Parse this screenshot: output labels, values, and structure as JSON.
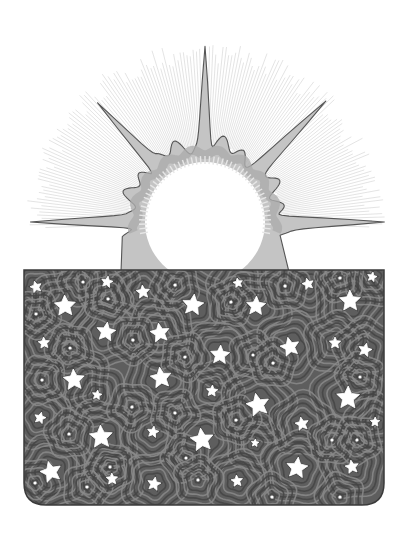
{
  "image": {
    "title": "Sun rising over a starry night panel",
    "description": "Grayscale illustration: a white sun disk with a spiky gray corona and faint radiating hatched rays, partially hidden behind a dark gray rectangular panel filled with white stars surrounded by concentric contour rings.",
    "width": 409,
    "height": 541
  },
  "colors": {
    "background": "#ffffff",
    "sun_core": "#ffffff",
    "corona_fill": "#c4c4c4",
    "corona_inner": "#adadad",
    "corona_stroke": "#555555",
    "ray_hatch": "#cfcfcf",
    "panel_fill": "#5e5e5e",
    "panel_ring_light": "#8a8a8a",
    "panel_ring_dark": "#444444",
    "panel_stroke": "#3a3a3a",
    "star_fill": "#ffffff"
  },
  "sun": {
    "cx": 205,
    "cy": 222,
    "core_r": 60,
    "hatch_r": 180,
    "spikes": [
      {
        "name": "left",
        "angle": 180,
        "length": 182
      },
      {
        "name": "upper-left",
        "angle": 228,
        "length": 170
      },
      {
        "name": "top",
        "angle": 270,
        "length": 182
      },
      {
        "name": "upper-right",
        "angle": 315,
        "length": 168
      },
      {
        "name": "right",
        "angle": 0,
        "length": 180
      }
    ]
  },
  "panel": {
    "x": 24,
    "y": 270,
    "w": 360,
    "h": 235,
    "radius": 22
  },
  "stars": [
    {
      "x": 36,
      "y": 287,
      "r": 6
    },
    {
      "x": 65,
      "y": 306,
      "r": 11
    },
    {
      "x": 107,
      "y": 282,
      "r": 6
    },
    {
      "x": 143,
      "y": 292,
      "r": 7
    },
    {
      "x": 193,
      "y": 305,
      "r": 11
    },
    {
      "x": 238,
      "y": 283,
      "r": 5
    },
    {
      "x": 256,
      "y": 306,
      "r": 10
    },
    {
      "x": 308,
      "y": 284,
      "r": 6
    },
    {
      "x": 350,
      "y": 301,
      "r": 11
    },
    {
      "x": 372,
      "y": 277,
      "r": 5
    },
    {
      "x": 44,
      "y": 343,
      "r": 6
    },
    {
      "x": 106,
      "y": 332,
      "r": 10
    },
    {
      "x": 160,
      "y": 333,
      "r": 10
    },
    {
      "x": 220,
      "y": 355,
      "r": 10
    },
    {
      "x": 290,
      "y": 347,
      "r": 10
    },
    {
      "x": 335,
      "y": 343,
      "r": 6
    },
    {
      "x": 365,
      "y": 350,
      "r": 7
    },
    {
      "x": 74,
      "y": 380,
      "r": 11
    },
    {
      "x": 97,
      "y": 395,
      "r": 5
    },
    {
      "x": 161,
      "y": 378,
      "r": 11
    },
    {
      "x": 212,
      "y": 391,
      "r": 6
    },
    {
      "x": 258,
      "y": 405,
      "r": 12
    },
    {
      "x": 348,
      "y": 398,
      "r": 12
    },
    {
      "x": 40,
      "y": 418,
      "r": 6
    },
    {
      "x": 101,
      "y": 437,
      "r": 12
    },
    {
      "x": 153,
      "y": 432,
      "r": 6
    },
    {
      "x": 202,
      "y": 440,
      "r": 12
    },
    {
      "x": 255,
      "y": 443,
      "r": 4
    },
    {
      "x": 302,
      "y": 424,
      "r": 7
    },
    {
      "x": 375,
      "y": 422,
      "r": 5
    },
    {
      "x": 51,
      "y": 472,
      "r": 11
    },
    {
      "x": 112,
      "y": 479,
      "r": 6
    },
    {
      "x": 154,
      "y": 484,
      "r": 7
    },
    {
      "x": 237,
      "y": 481,
      "r": 6
    },
    {
      "x": 297,
      "y": 468,
      "r": 11
    },
    {
      "x": 352,
      "y": 467,
      "r": 7
    }
  ],
  "dots": [
    {
      "x": 83,
      "y": 282
    },
    {
      "x": 175,
      "y": 285
    },
    {
      "x": 36,
      "y": 314
    },
    {
      "x": 108,
      "y": 299
    },
    {
      "x": 231,
      "y": 302
    },
    {
      "x": 285,
      "y": 286
    },
    {
      "x": 340,
      "y": 278
    },
    {
      "x": 70,
      "y": 348
    },
    {
      "x": 133,
      "y": 340
    },
    {
      "x": 185,
      "y": 357
    },
    {
      "x": 253,
      "y": 355
    },
    {
      "x": 273,
      "y": 363
    },
    {
      "x": 360,
      "y": 377
    },
    {
      "x": 42,
      "y": 380
    },
    {
      "x": 132,
      "y": 407
    },
    {
      "x": 175,
      "y": 413
    },
    {
      "x": 236,
      "y": 420
    },
    {
      "x": 332,
      "y": 440
    },
    {
      "x": 69,
      "y": 434
    },
    {
      "x": 186,
      "y": 458
    },
    {
      "x": 357,
      "y": 440
    },
    {
      "x": 35,
      "y": 483
    },
    {
      "x": 87,
      "y": 487
    },
    {
      "x": 198,
      "y": 480
    },
    {
      "x": 272,
      "y": 497
    },
    {
      "x": 340,
      "y": 497
    },
    {
      "x": 110,
      "y": 467
    }
  ]
}
